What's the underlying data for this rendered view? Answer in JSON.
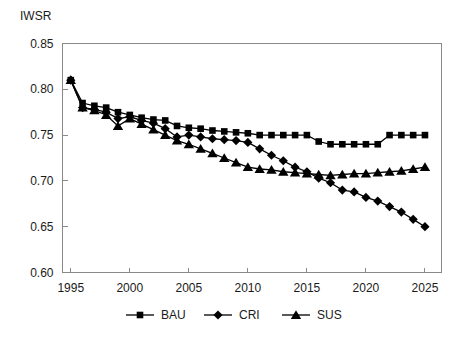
{
  "chart_data": {
    "type": "line",
    "title": "IWSR",
    "xlabel": "",
    "ylabel": "",
    "xlim": [
      1994.2,
      1994.2
    ],
    "ylim": [
      0.6,
      0.85
    ],
    "yticks": [
      0.6,
      0.65,
      0.7,
      0.75,
      0.8,
      0.85
    ],
    "ytick_labels": [
      "0.60",
      "0.65",
      "0.70",
      "0.75",
      "0.80",
      "0.85"
    ],
    "xticks": [
      1995,
      2000,
      2005,
      2010,
      2015,
      2020,
      2025
    ],
    "xtick_labels": [
      "1995",
      "2000",
      "2005",
      "2010",
      "2015",
      "2020",
      "2025"
    ],
    "x_axis_min": 1994.3,
    "x_axis_max": 2026.4,
    "grid": false,
    "legend_position": "bottom",
    "x": [
      1995,
      1996,
      1997,
      1998,
      1999,
      2000,
      2001,
      2002,
      2003,
      2004,
      2005,
      2006,
      2007,
      2008,
      2009,
      2010,
      2011,
      2012,
      2013,
      2014,
      2015,
      2016,
      2017,
      2018,
      2019,
      2020,
      2021,
      2022,
      2023,
      2024,
      2025
    ],
    "series": [
      {
        "name": "BAU",
        "marker": "square",
        "values": [
          0.81,
          0.785,
          0.782,
          0.78,
          0.775,
          0.772,
          0.769,
          0.767,
          0.766,
          0.76,
          0.758,
          0.757,
          0.755,
          0.754,
          0.753,
          0.752,
          0.75,
          0.75,
          0.75,
          0.75,
          0.75,
          0.743,
          0.74,
          0.74,
          0.74,
          0.74,
          0.74,
          0.75,
          0.75,
          0.75,
          0.75
        ]
      },
      {
        "name": "CRI",
        "marker": "diamond",
        "values": [
          0.81,
          0.78,
          0.778,
          0.775,
          0.768,
          0.77,
          0.766,
          0.763,
          0.757,
          0.748,
          0.75,
          0.748,
          0.746,
          0.745,
          0.744,
          0.742,
          0.735,
          0.728,
          0.722,
          0.715,
          0.71,
          0.703,
          0.698,
          0.69,
          0.688,
          0.682,
          0.678,
          0.672,
          0.666,
          0.658,
          0.65
        ]
      },
      {
        "name": "SUS",
        "marker": "triangle",
        "values": [
          0.81,
          0.78,
          0.777,
          0.772,
          0.76,
          0.768,
          0.762,
          0.756,
          0.75,
          0.744,
          0.74,
          0.735,
          0.73,
          0.725,
          0.72,
          0.715,
          0.713,
          0.712,
          0.71,
          0.709,
          0.708,
          0.707,
          0.706,
          0.707,
          0.708,
          0.708,
          0.709,
          0.71,
          0.711,
          0.713,
          0.715
        ]
      }
    ]
  },
  "legend": {
    "items": [
      {
        "label": "BAU",
        "marker": "square"
      },
      {
        "label": "CRI",
        "marker": "diamond"
      },
      {
        "label": "SUS",
        "marker": "triangle"
      }
    ]
  }
}
